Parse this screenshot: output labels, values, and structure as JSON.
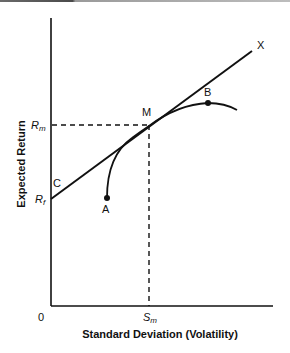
{
  "diagram": {
    "x_axis_label": "Standard Deviation (Volatility)",
    "y_axis_label": "Expected Return",
    "origin_label": "0",
    "x_tick": {
      "main": "S",
      "sub": "m"
    },
    "y_ticks": [
      {
        "main": "R",
        "sub": "m"
      },
      {
        "main": "R",
        "sub": "f"
      }
    ],
    "points": {
      "A": "A",
      "B": "B",
      "C": "C",
      "M": "M",
      "X": "X"
    },
    "colors": {
      "line": "#111111",
      "background": "#ffffff"
    }
  }
}
